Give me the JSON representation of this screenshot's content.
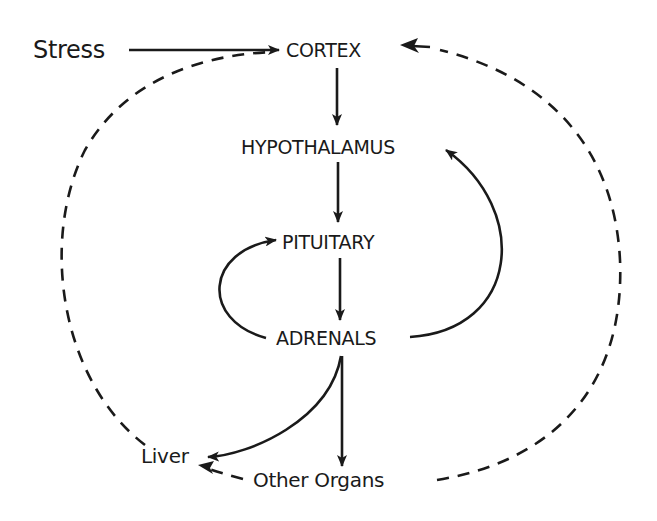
{
  "diagram": {
    "nodes": {
      "stress": "Stress",
      "cortex": "CORTEX",
      "hypothalamus": "HYPOTHALAMUS",
      "pituitary": "PITUITARY",
      "adrenals": "ADRENALS",
      "liver": "Liver",
      "other_organs": "Other Organs"
    },
    "edges": [
      {
        "from": "Stress",
        "to": "CORTEX",
        "style": "solid"
      },
      {
        "from": "CORTEX",
        "to": "HYPOTHALAMUS",
        "style": "solid"
      },
      {
        "from": "HYPOTHALAMUS",
        "to": "PITUITARY",
        "style": "solid"
      },
      {
        "from": "PITUITARY",
        "to": "ADRENALS",
        "style": "solid"
      },
      {
        "from": "ADRENALS",
        "to": "PITUITARY",
        "style": "solid-curved"
      },
      {
        "from": "ADRENALS",
        "to": "HYPOTHALAMUS",
        "style": "solid-curved"
      },
      {
        "from": "ADRENALS",
        "to": "Liver",
        "style": "solid-curved"
      },
      {
        "from": "ADRENALS",
        "to": "Other Organs",
        "style": "solid"
      },
      {
        "from": "Liver",
        "to": "CORTEX",
        "style": "dashed"
      },
      {
        "from": "Other Organs",
        "to": "CORTEX",
        "style": "dashed"
      },
      {
        "from": "Other Organs",
        "to": "Liver",
        "style": "dashed"
      }
    ],
    "colors": {
      "ink": "#1a1a1a",
      "background": "#ffffff"
    }
  }
}
